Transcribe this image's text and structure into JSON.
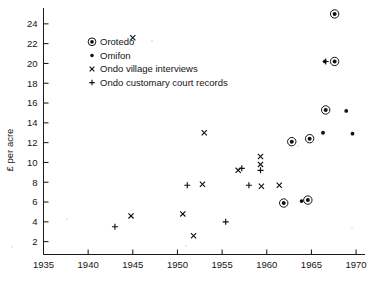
{
  "chart_data": {
    "type": "scatter",
    "title": "",
    "xlabel": "",
    "ylabel": "£ per acre",
    "xlim": [
      1935,
      1971
    ],
    "ylim": [
      0.7,
      25.6
    ],
    "grid": false,
    "legend_position": "upper-left-inside",
    "x_ticks": [
      1935,
      1940,
      1945,
      1950,
      1955,
      1960,
      1965,
      1970
    ],
    "x_tick_labels": [
      "1935",
      "1940",
      "1945",
      "1950",
      "1955",
      "1960",
      "1965",
      "1970"
    ],
    "y_ticks": [
      2,
      4,
      6,
      8,
      10,
      12,
      14,
      16,
      18,
      20,
      22,
      24
    ],
    "y_tick_labels": [
      "2",
      "4",
      "6",
      "8",
      "10",
      "12",
      "14",
      "16",
      "18",
      "20",
      "22",
      "24"
    ],
    "series": [
      {
        "name": "Orotedo",
        "marker": "circled-dot",
        "points": [
          {
            "x": 1967.6,
            "y": 25.0
          },
          {
            "x": 1967.6,
            "y": 20.2
          },
          {
            "x": 1966.6,
            "y": 15.3
          },
          {
            "x": 1964.8,
            "y": 12.4
          },
          {
            "x": 1962.8,
            "y": 12.1
          },
          {
            "x": 1964.6,
            "y": 6.2
          },
          {
            "x": 1961.9,
            "y": 5.9
          }
        ]
      },
      {
        "name": "Omifon",
        "marker": "dot",
        "points": [
          {
            "x": 1966.5,
            "y": 20.2
          },
          {
            "x": 1968.9,
            "y": 15.2
          },
          {
            "x": 1966.3,
            "y": 13.0
          },
          {
            "x": 1969.6,
            "y": 12.9
          },
          {
            "x": 1963.9,
            "y": 6.1
          }
        ]
      },
      {
        "name": "Ondo village interviews",
        "marker": "cross-x",
        "points": [
          {
            "x": 1945.0,
            "y": 22.6
          },
          {
            "x": 1944.8,
            "y": 4.6
          },
          {
            "x": 1950.6,
            "y": 4.8
          },
          {
            "x": 1951.8,
            "y": 2.6
          },
          {
            "x": 1953.0,
            "y": 13.0
          },
          {
            "x": 1952.8,
            "y": 7.8
          },
          {
            "x": 1956.8,
            "y": 9.2
          },
          {
            "x": 1959.3,
            "y": 10.6
          },
          {
            "x": 1959.3,
            "y": 9.8
          },
          {
            "x": 1959.4,
            "y": 7.6
          },
          {
            "x": 1961.4,
            "y": 7.7
          }
        ]
      },
      {
        "name": "Ondo customary court records",
        "marker": "plus",
        "points": [
          {
            "x": 1943.0,
            "y": 3.5
          },
          {
            "x": 1951.1,
            "y": 7.7
          },
          {
            "x": 1955.4,
            "y": 4.0
          },
          {
            "x": 1957.2,
            "y": 9.4
          },
          {
            "x": 1959.3,
            "y": 9.2
          },
          {
            "x": 1958.0,
            "y": 7.7
          },
          {
            "x": 1966.6,
            "y": 20.2
          }
        ]
      }
    ]
  },
  "legend": {
    "items": [
      {
        "label": "Orotedo",
        "marker": "circled-dot"
      },
      {
        "label": "Omifon",
        "marker": "dot"
      },
      {
        "label": "Ondo village interviews",
        "marker": "cross-x"
      },
      {
        "label": "Ondo customary court records",
        "marker": "plus"
      }
    ]
  }
}
